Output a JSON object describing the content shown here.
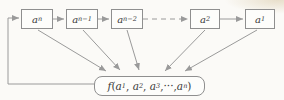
{
  "diagram": {
    "colors": {
      "background": "#fbfaf7",
      "line": "#9a9a9a",
      "box_border": "#8f8f8f",
      "text": "#3a3a3a"
    },
    "nodes": [
      {
        "id": "a_n",
        "parts": [
          {
            "t": "i",
            "v": "a"
          },
          {
            "t": "s",
            "v": "n"
          }
        ]
      },
      {
        "id": "a_n-1",
        "parts": [
          {
            "t": "i",
            "v": "a"
          },
          {
            "t": "s",
            "v": "n−1"
          }
        ]
      },
      {
        "id": "a_n-2",
        "parts": [
          {
            "t": "i",
            "v": "a"
          },
          {
            "t": "s",
            "v": "n−2"
          }
        ]
      },
      {
        "id": "a_2",
        "parts": [
          {
            "t": "i",
            "v": "a"
          },
          {
            "t": "s",
            "v": "2"
          }
        ]
      },
      {
        "id": "a_1",
        "parts": [
          {
            "t": "i",
            "v": "a"
          },
          {
            "t": "s",
            "v": "1"
          }
        ]
      }
    ],
    "function_box": {
      "id": "f",
      "parts": [
        {
          "t": "i",
          "v": "f"
        },
        {
          "t": "t",
          "v": "("
        },
        {
          "t": "i",
          "v": "a"
        },
        {
          "t": "s",
          "v": "1"
        },
        {
          "t": "t",
          "v": ", "
        },
        {
          "t": "i",
          "v": "a"
        },
        {
          "t": "s",
          "v": "2"
        },
        {
          "t": "t",
          "v": ", "
        },
        {
          "t": "i",
          "v": "a"
        },
        {
          "t": "s",
          "v": "3"
        },
        {
          "t": "t",
          "v": ",···,"
        },
        {
          "t": "i",
          "v": "a"
        },
        {
          "t": "s",
          "v": "n"
        },
        {
          "t": "t",
          "v": ")"
        }
      ]
    },
    "edges": [
      {
        "from": "f",
        "to": "a_n",
        "style": "solid",
        "kind": "feedback"
      },
      {
        "from": "a_n",
        "to": "a_n-1",
        "style": "solid",
        "kind": "chain"
      },
      {
        "from": "a_n-1",
        "to": "a_n-2",
        "style": "solid",
        "kind": "chain"
      },
      {
        "from": "a_n-2",
        "to": "a_2",
        "style": "dashed",
        "kind": "chain-ellipsis"
      },
      {
        "from": "a_2",
        "to": "a_1",
        "style": "solid",
        "kind": "chain"
      },
      {
        "from": "a_n",
        "to": "f",
        "style": "solid",
        "kind": "input"
      },
      {
        "from": "a_n-1",
        "to": "f",
        "style": "solid",
        "kind": "input"
      },
      {
        "from": "a_n-2",
        "to": "f",
        "style": "solid",
        "kind": "input"
      },
      {
        "from": "a_2",
        "to": "f",
        "style": "solid",
        "kind": "input"
      },
      {
        "from": "a_1",
        "to": "f",
        "style": "solid",
        "kind": "input"
      }
    ]
  }
}
